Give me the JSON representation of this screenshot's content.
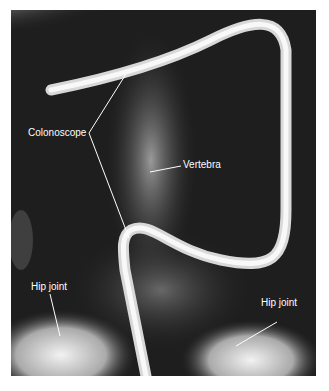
{
  "figure": {
    "labels": {
      "colonoscope": "Colonoscope",
      "vertebra": "Vertebra",
      "hip_left": "Hip joint",
      "hip_right": "Hip joint"
    }
  }
}
